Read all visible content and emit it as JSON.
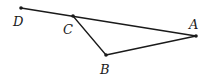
{
  "diagram": {
    "type": "geometry",
    "points": [
      {
        "id": "D",
        "label": "D",
        "x": 21,
        "y": 8,
        "lx": 13,
        "ly": 26
      },
      {
        "id": "C",
        "label": "C",
        "x": 73,
        "y": 16,
        "lx": 63,
        "ly": 34
      },
      {
        "id": "A",
        "label": "A",
        "x": 196,
        "y": 36,
        "lx": 189,
        "ly": 29
      },
      {
        "id": "B",
        "label": "B",
        "x": 106,
        "y": 55,
        "lx": 100,
        "ly": 74
      }
    ],
    "segments": [
      {
        "from": "D",
        "to": "A",
        "note": "line D-A passes through C"
      },
      {
        "from": "C",
        "to": "B"
      },
      {
        "from": "B",
        "to": "A"
      }
    ],
    "colors": {
      "stroke": "#1a1a1a",
      "background": "#ffffff"
    }
  }
}
